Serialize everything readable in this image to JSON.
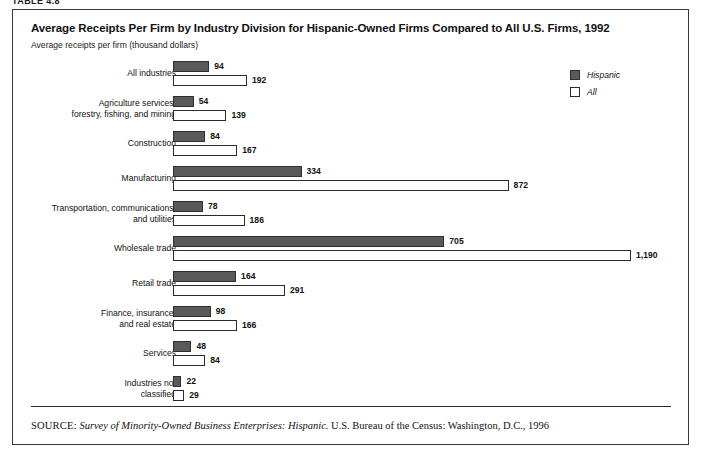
{
  "figure_caption": "TABLE 4.8",
  "header": {
    "title": "Average Receipts Per Firm by Industry Division for Hispanic-Owned Firms Compared to All U.S. Firms, 1992",
    "subtitle": "Average receipts per firm (thousand dollars)"
  },
  "legend": {
    "items": [
      {
        "label": "Hispanic",
        "color": "#595959"
      },
      {
        "label": "All",
        "color": "#ffffff"
      }
    ]
  },
  "source": {
    "label": "SOURCE:",
    "italic_part": "Survey of Minority-Owned Business Enterprises: Hispanic.",
    "rest": " U.S. Bureau of the Census: Washington, D.C., 1996"
  },
  "chart_data": {
    "type": "bar",
    "orientation": "horizontal",
    "title": "Average Receipts Per Firm by Industry Division for Hispanic-Owned Firms Compared to All U.S. Firms, 1992",
    "subtitle": "Average receipts per firm (thousand dollars)",
    "xlabel": "Average receipts per firm (thousand dollars)",
    "ylabel": "",
    "xlim": [
      0,
      1190
    ],
    "grid": false,
    "legend_position": "top-right",
    "categories": [
      "All industries",
      "Agriculture services, forestry, fishing, and mining",
      "Construction",
      "Manufacturing",
      "Transportation, communications, and utilities",
      "Wholesale trade",
      "Retail trade",
      "Finance, insurance, and real estate",
      "Services",
      "Industries not classified"
    ],
    "category_lines": [
      [
        "All industries"
      ],
      [
        "Agriculture services,",
        "forestry, fishing, and mining"
      ],
      [
        "Construction"
      ],
      [
        "Manufacturing"
      ],
      [
        "Transportation, communications,",
        "and utilities"
      ],
      [
        "Wholesale trade"
      ],
      [
        "Retail trade"
      ],
      [
        "Finance, insurance,",
        "and real estate"
      ],
      [
        "Services"
      ],
      [
        "Industries not",
        "classified"
      ]
    ],
    "series": [
      {
        "name": "Hispanic",
        "color": "#595959",
        "values": [
          94,
          54,
          84,
          334,
          78,
          705,
          164,
          98,
          48,
          22
        ],
        "labels": [
          "94",
          "54",
          "84",
          "334",
          "78",
          "705",
          "164",
          "98",
          "48",
          "22"
        ]
      },
      {
        "name": "All",
        "color": "#ffffff",
        "values": [
          192,
          139,
          167,
          872,
          186,
          1190,
          291,
          166,
          84,
          29
        ],
        "labels": [
          "192",
          "139",
          "167",
          "872",
          "186",
          "1,190",
          "291",
          "166",
          "84",
          "29"
        ]
      }
    ]
  }
}
